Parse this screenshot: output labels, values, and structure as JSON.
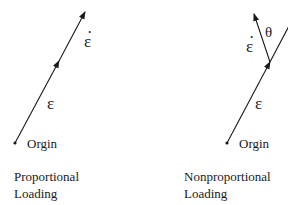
{
  "panels": {
    "proportional": {
      "strain_label": "ε",
      "rate_label": "ε",
      "origin_label": "Orgin",
      "caption_line1": "Proportional",
      "caption_line2": "Loading"
    },
    "nonproportional": {
      "strain_label": "ε",
      "rate_label": "ε",
      "angle_label": "θ",
      "origin_label": "Orgin",
      "caption_line1": "Nonproportional",
      "caption_line2": "Loading"
    }
  }
}
